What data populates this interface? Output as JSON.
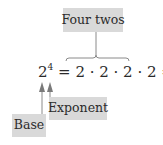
{
  "labels": {
    "top": "Four twos",
    "exponent": "Exponent",
    "base": "Base"
  },
  "equation": {
    "base": "2",
    "exponent": "4",
    "equals1": "=",
    "expansion": "2 · 2 · 2 · 2",
    "equals2": "=",
    "result": "16"
  },
  "colors": {
    "label_background": "#d9d9d9",
    "line": "#8a8a8a",
    "text": "#2a2a2a"
  }
}
